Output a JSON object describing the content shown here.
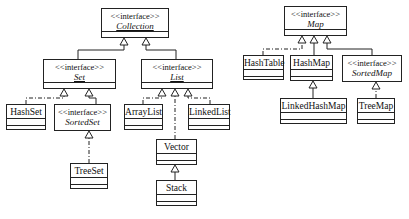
{
  "diagram": {
    "stereotype": "<<interface>>",
    "interfaces": {
      "collection": "Collection",
      "set": "Set",
      "list": "List",
      "sorted_set": "SortedSet",
      "map": "Map",
      "sorted_map": "SortedMap"
    },
    "classes": {
      "hash_set": "HashSet",
      "tree_set": "TreeSet",
      "array_list": "ArrayList",
      "linked_list": "LinkedList",
      "vector": "Vector",
      "stack": "Stack",
      "hash_table": "HashTable",
      "hash_map": "HashMap",
      "linked_hash_map": "LinkedHashMap",
      "tree_map": "TreeMap"
    },
    "relations": [
      {
        "from": "Set",
        "to": "Collection",
        "type": "generalization"
      },
      {
        "from": "List",
        "to": "Collection",
        "type": "generalization"
      },
      {
        "from": "HashSet",
        "to": "Set",
        "type": "realization"
      },
      {
        "from": "SortedSet",
        "to": "Set",
        "type": "generalization"
      },
      {
        "from": "TreeSet",
        "to": "SortedSet",
        "type": "realization"
      },
      {
        "from": "ArrayList",
        "to": "List",
        "type": "realization"
      },
      {
        "from": "Vector",
        "to": "List",
        "type": "realization"
      },
      {
        "from": "LinkedList",
        "to": "List",
        "type": "realization"
      },
      {
        "from": "Stack",
        "to": "Vector",
        "type": "generalization"
      },
      {
        "from": "HashTable",
        "to": "Map",
        "type": "realization"
      },
      {
        "from": "HashMap",
        "to": "Map",
        "type": "realization"
      },
      {
        "from": "SortedMap",
        "to": "Map",
        "type": "generalization"
      },
      {
        "from": "LinkedHashMap",
        "to": "HashMap",
        "type": "generalization"
      },
      {
        "from": "TreeMap",
        "to": "SortedMap",
        "type": "realization"
      }
    ]
  }
}
